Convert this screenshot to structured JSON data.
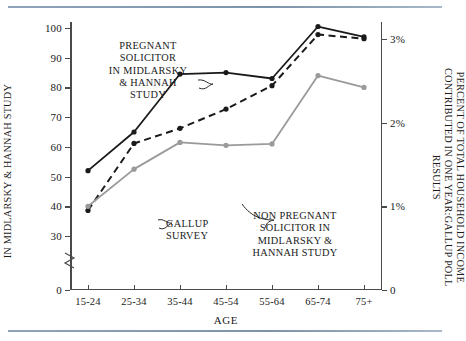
{
  "chart_data": {
    "type": "line",
    "title": "",
    "xlabel": "AGE",
    "categories": [
      "15-24",
      "25-34",
      "35-44",
      "45-54",
      "55-64",
      "65-74",
      "75+"
    ],
    "ylabel_left": "PERCENT OF ADULTS WHO CONTRIBUTED\nIN MIDLARSKY & HANNAH STUDY",
    "ylabel_right": "PERCENT OF TOTAL HOUSEHOLD INCOME\nCONTRIBUTED IN ONE YEAR:GALLUP POLL RESULTS",
    "ylim_left": [
      0,
      100
    ],
    "ylim_right": [
      0,
      3.2
    ],
    "yticks_left": [
      100,
      90,
      80,
      70,
      60,
      50,
      40,
      30,
      0
    ],
    "ytick_labels_left": [
      "100",
      "90",
      "80",
      "70",
      "60",
      "50",
      "40",
      "30",
      "0"
    ],
    "yticks_right": [
      0,
      1,
      2,
      3
    ],
    "ytick_labels_right": [
      "0",
      "1%",
      "2%",
      "3%"
    ],
    "axis_break_left": true,
    "grid": false,
    "legend": "annotations",
    "series": [
      {
        "name": "PREGNANT SOLICITOR IN MIDLARSKY & HANNAH STUDY",
        "axis": "left",
        "style": "solid",
        "color": "#1a1a1a",
        "marker": "circle",
        "values": [
          52,
          65,
          84.5,
          85,
          83,
          100.5,
          97
        ]
      },
      {
        "name": "GALLUP SURVEY",
        "axis": "right",
        "style": "dashed",
        "color": "#1a1a1a",
        "marker": "circle",
        "values": [
          32,
          57,
          62,
          68.5,
          76,
          93,
          91.5
        ],
        "values_percent": [
          0.95,
          1.75,
          1.93,
          2.16,
          2.44,
          3.05,
          3.0
        ]
      },
      {
        "name": "NON PREGNANT SOLICITOR IN MIDLARSKY & HANNAH STUDY",
        "axis": "left",
        "style": "solid",
        "color": "#9a9a9a",
        "marker": "circle",
        "values": [
          40,
          52.5,
          61.5,
          60.5,
          61,
          84,
          80
        ]
      }
    ],
    "annotations": [
      {
        "id": "pregnant",
        "text": "PREGNANT\nSOLICITOR\nIN MIDLARSKY\n& HANNAH\nSTUDY"
      },
      {
        "id": "gallup",
        "text": "GALLUP\nSURVEY"
      },
      {
        "id": "nonpregnant",
        "text": "NON PREGNANT\nSOLICITOR IN\nMIDLARSKY &\nHANNAH STUDY"
      }
    ]
  },
  "colors": {
    "rule": "#7d93a8",
    "axis": "#4a4a4a",
    "series_dark": "#1a1a1a",
    "series_gray": "#9a9a9a"
  }
}
